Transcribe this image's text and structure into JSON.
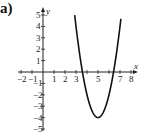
{
  "panel_label": "a)",
  "chart_data": {
    "type": "line",
    "title": "",
    "xlabel": "x",
    "ylabel": "y",
    "function": "y = 2(x - 5)^2 - 4",
    "vertex": [
      5,
      -4
    ],
    "x_intercepts": [
      3.59,
      6.41
    ],
    "xlim": [
      -2,
      8
    ],
    "ylim": [
      -5,
      5
    ],
    "x_tick_labels": [
      "-2",
      "-1",
      "1",
      "2",
      "3",
      "5",
      "7",
      "8"
    ],
    "y_tick_labels": [
      "5",
      "4",
      "3",
      "2",
      "1",
      "-1",
      "-2",
      "-3",
      "-4",
      "-5"
    ],
    "grid": false,
    "series": [
      {
        "name": "parabola",
        "x": [
          2.9,
          3.5,
          4,
          4.5,
          5,
          5.5,
          6,
          6.5,
          7.1
        ],
        "y": [
          4.82,
          0.5,
          -2,
          -3.5,
          -4,
          -3.5,
          -2,
          0.5,
          4.82
        ]
      }
    ]
  }
}
